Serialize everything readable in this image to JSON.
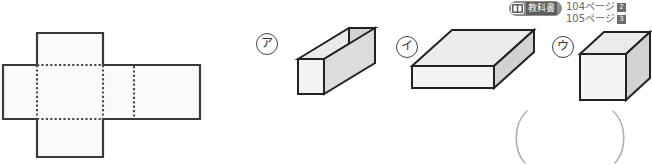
{
  "figure": {
    "net": {
      "name": "net-of-rectangular-prism",
      "description": "cross-shaped net with dotted fold lines",
      "fold_line_style": "dotted",
      "outline_color": "#3a3a3a",
      "face_fill": "#fafafa"
    },
    "solids": [
      {
        "label": "ア",
        "name": "long-rectangular-prism",
        "shape": "rectangular prism, long and narrow",
        "top_face_color": "#ebebeb",
        "front_face_color": "#f2f2f2",
        "side_face_color": "#d2d2d2",
        "edge_color": "#222222"
      },
      {
        "label": "イ",
        "name": "flat-slab-prism",
        "shape": "rectangular prism, wide and flat",
        "top_face_color": "#ebebeb",
        "front_face_color": "#f2f2f2",
        "side_face_color": "#d2d2d2",
        "edge_color": "#222222"
      },
      {
        "label": "ウ",
        "name": "cube",
        "shape": "cube",
        "top_face_color": "#ebebeb",
        "front_face_color": "#f2f2f2",
        "side_face_color": "#d2d2d2",
        "edge_color": "#222222"
      }
    ],
    "answer_blank": {
      "name": "answer-parentheses",
      "open": "(",
      "close": ")",
      "stroke_color": "#b0b0b0"
    }
  },
  "badge": {
    "icon": "open-book-icon",
    "label": "教科書",
    "pill_color": "#8f8f8f",
    "label_bg": "#5c5c5c",
    "page_refs": [
      {
        "page": "104ページ",
        "num": "2"
      },
      {
        "page": "105ページ",
        "num": "3"
      }
    ]
  }
}
